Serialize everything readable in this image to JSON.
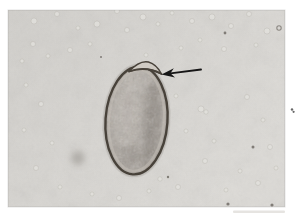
{
  "figure": {
    "kind": "light photomicrograph",
    "annotation": "arrow pointing to operculum"
  },
  "colors": {
    "page": "#ffffff",
    "photo_bg_light": "#dcdad6",
    "photo_bg_dark": "#d1cfcb",
    "shell": "#48423a",
    "egg_base": "#a8a199",
    "egg_light": "#c6c0b8",
    "egg_dark": "#857e76",
    "lid_fill": "#cfcac3",
    "arrow": "#161616",
    "speck_light": "#e3e1dd",
    "speck_rim": "#b6b2ac",
    "speck_dark": "#6b6660",
    "smudge": "#8f8b85",
    "margin_ink": "#4c4c4c"
  },
  "scene": {
    "photo": {
      "x": 8,
      "y": 10,
      "w": 277,
      "h": 197
    },
    "egg": {
      "cx": 136.5,
      "cy": 120.5,
      "rx": 31,
      "ry": 54,
      "rotate": 4
    },
    "arrow": {
      "tip_x": 161.5,
      "tip_y": 74.5,
      "tail_x": 201,
      "tail_y": 69.5
    },
    "smudge": {
      "cx": 78,
      "cy": 158,
      "r": 7
    },
    "margin_specks": [
      {
        "cx": 292,
        "cy": 109.5,
        "r": 1.2
      },
      {
        "cx": 293.6,
        "cy": 111.8,
        "r": 1.1
      }
    ],
    "specks": [
      [
        34,
        21,
        3,
        "l"
      ],
      [
        57,
        14,
        2.5,
        "l"
      ],
      [
        78,
        28,
        2,
        "l"
      ],
      [
        97,
        24,
        3,
        "l"
      ],
      [
        117,
        11,
        2.5,
        "l"
      ],
      [
        127,
        30,
        2.5,
        "l"
      ],
      [
        143,
        17,
        3,
        "l"
      ],
      [
        158,
        24,
        2,
        "l"
      ],
      [
        172,
        13,
        2,
        "l"
      ],
      [
        192,
        21,
        2.5,
        "l"
      ],
      [
        212,
        17,
        3,
        "l"
      ],
      [
        231,
        26,
        2.5,
        "l"
      ],
      [
        249,
        14,
        2.5,
        "l"
      ],
      [
        267,
        31,
        3,
        "l"
      ],
      [
        256,
        45,
        2,
        "l"
      ],
      [
        224,
        49,
        2.5,
        "l"
      ],
      [
        200,
        40,
        2,
        "l"
      ],
      [
        181,
        48,
        2,
        "l"
      ],
      [
        146,
        55,
        2,
        "l"
      ],
      [
        90,
        44,
        2,
        "l"
      ],
      [
        70,
        50,
        2.5,
        "l"
      ],
      [
        48,
        56,
        2,
        "l"
      ],
      [
        33,
        44,
        2.5,
        "l"
      ],
      [
        22,
        61,
        2,
        "l"
      ],
      [
        26,
        85,
        2,
        "l"
      ],
      [
        41,
        104,
        2.5,
        "l"
      ],
      [
        24,
        130,
        2,
        "l"
      ],
      [
        52,
        143,
        2,
        "l"
      ],
      [
        36,
        168,
        2.5,
        "l"
      ],
      [
        60,
        187,
        2,
        "l"
      ],
      [
        92,
        194,
        2,
        "l"
      ],
      [
        119,
        198,
        2.5,
        "l"
      ],
      [
        149,
        191,
        2,
        "l"
      ],
      [
        178,
        187,
        2.5,
        "l"
      ],
      [
        205,
        161,
        2.5,
        "l"
      ],
      [
        214,
        141,
        2,
        "l"
      ],
      [
        186,
        131,
        2,
        "l"
      ],
      [
        176,
        96,
        2,
        "l"
      ],
      [
        201,
        109,
        3,
        "l"
      ],
      [
        206,
        112,
        2.2,
        "l"
      ],
      [
        247,
        97,
        2.5,
        "l"
      ],
      [
        263,
        120,
        2,
        "l"
      ],
      [
        270,
        147,
        2.5,
        "l"
      ],
      [
        240,
        171,
        2,
        "l"
      ],
      [
        226,
        190,
        2,
        "l"
      ],
      [
        258,
        183,
        2.5,
        "l"
      ],
      [
        276,
        168,
        2,
        "l"
      ],
      [
        160,
        179,
        2.2,
        "l"
      ],
      [
        225,
        33,
        1.4,
        "d"
      ],
      [
        253,
        147,
        1.5,
        "d"
      ],
      [
        228,
        204,
        1.6,
        "d"
      ],
      [
        272,
        205,
        1.6,
        "d"
      ],
      [
        168,
        177,
        1.2,
        "d"
      ],
      [
        101,
        57,
        1,
        "d"
      ],
      [
        279,
        28,
        2.2,
        "r"
      ]
    ]
  }
}
